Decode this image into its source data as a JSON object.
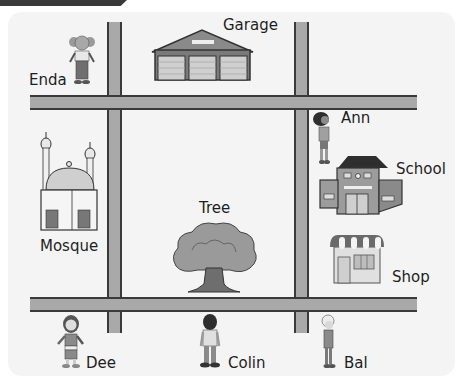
{
  "map": {
    "title": "Town map",
    "places": {
      "garage": "Garage",
      "mosque": "Mosque",
      "tree": "Tree",
      "school": "School",
      "shop": "Shop"
    },
    "people": {
      "enda": "Enda",
      "ann": "Ann",
      "dee": "Dee",
      "colin": "Colin",
      "bal": "Bal"
    },
    "icons": {
      "garage": "garage-icon",
      "mosque": "mosque-icon",
      "tree": "tree-icon",
      "school": "school-icon",
      "shop": "shop-icon",
      "person": "person-icon"
    },
    "colors": {
      "road": "#a9a9a9",
      "road_edge": "#3a3a3a",
      "background": "#f4f4f4",
      "text": "#1e1e1e"
    }
  }
}
